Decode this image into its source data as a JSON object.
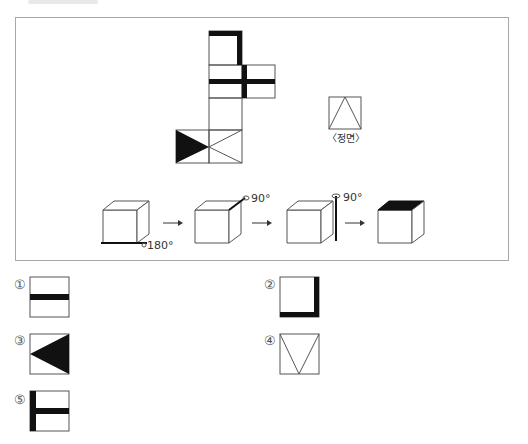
{
  "problem": {
    "front_view_label": "〈정면〉",
    "rotation_steps": [
      {
        "step": 1,
        "angle_label": "180°",
        "axis": "bottom-front edge"
      },
      {
        "step": 2,
        "angle_label": "90°",
        "axis": "top-right edge"
      },
      {
        "step": 3,
        "angle_label": "90°",
        "axis": "vertical right edge"
      }
    ],
    "result_cube": {
      "shaded_face": "top"
    }
  },
  "options": [
    {
      "marker": "①",
      "pattern": "horizontal-band"
    },
    {
      "marker": "②",
      "pattern": "right-and-bottom-border"
    },
    {
      "marker": "③",
      "pattern": "left-pointing-triangle"
    },
    {
      "marker": "④",
      "pattern": "v-lines"
    },
    {
      "marker": "⑤",
      "pattern": "t-shape-left-bar"
    }
  ],
  "colors": {
    "ink": "#111111",
    "line": "#555555",
    "frame": "#a8a8a8"
  }
}
